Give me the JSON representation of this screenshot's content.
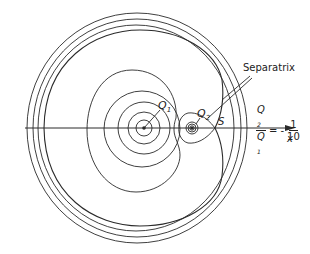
{
  "figure": {
    "axis_label": "x",
    "charges": [
      {
        "name": "Q1",
        "label_main": "Q",
        "label_sub": "1",
        "x": 144,
        "y": 128
      },
      {
        "name": "Q2",
        "label_main": "Q",
        "label_sub": "2",
        "x": 192,
        "y": 128
      }
    ],
    "saddle_point_label": "S",
    "separatrix_label": "Separatrix",
    "ratio": {
      "numerator": "Q2",
      "numerator_main": "Q",
      "numerator_sub": "2",
      "denominator_main": "Q",
      "denominator_sub": "1",
      "equals": "= -",
      "value_numerator": "1",
      "value_denominator": "10"
    },
    "line_color": "#2a2a2a"
  }
}
